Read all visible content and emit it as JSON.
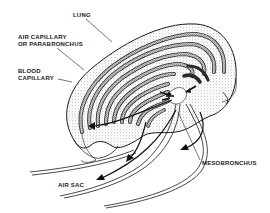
{
  "diagram": {
    "labels": {
      "lung": "LUNG",
      "air_capillary_line1": "AIR CAPILLARY",
      "air_capillary_line2": "OR PARABRONCHUS",
      "blood_capillary_line1": "BLOOD",
      "blood_capillary_line2": "CAPILLARY",
      "mesobronchus": "MESOBRONCHUS",
      "air_sac": "AIR SAC"
    },
    "colors": {
      "ink": "#1a1a1a",
      "stipple": "#8a8a8a",
      "background": "#ffffff"
    }
  }
}
